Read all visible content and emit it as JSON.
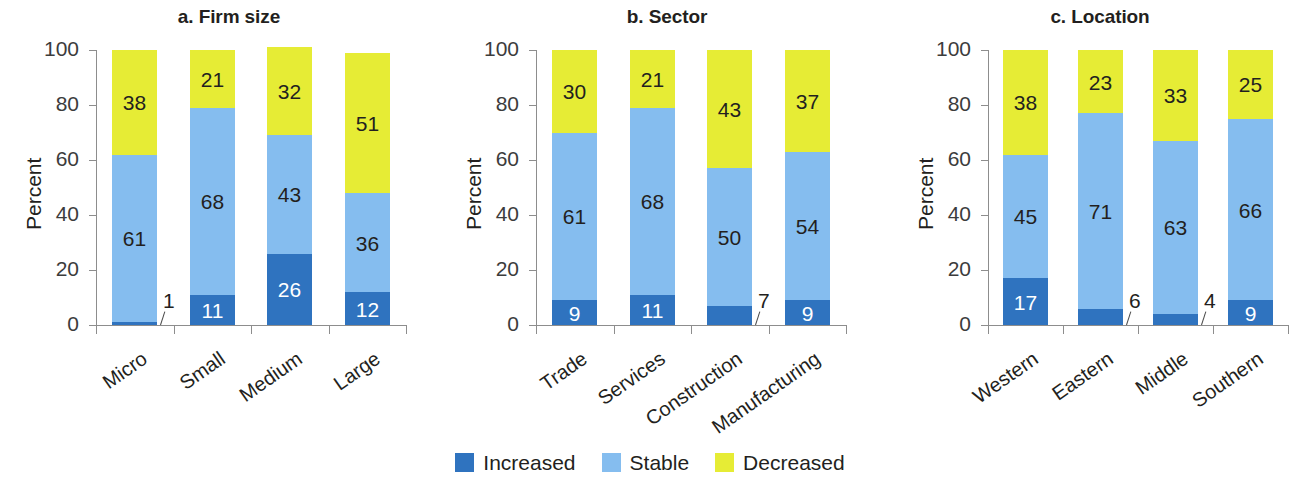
{
  "figure": {
    "y_axis_title": "Percent",
    "y_ticks": [
      "0",
      "20",
      "40",
      "60",
      "80",
      "100"
    ]
  },
  "legend": {
    "items": [
      {
        "label": "Increased",
        "color": "#2f73bf"
      },
      {
        "label": "Stable",
        "color": "#85bdef"
      },
      {
        "label": "Decreased",
        "color": "#e6ec35"
      }
    ]
  },
  "chart_data": [
    {
      "type": "bar",
      "stacked": true,
      "title": "a. Firm size",
      "xlabel": "",
      "ylabel": "Percent",
      "ylim": [
        0,
        100
      ],
      "yticks": [
        0,
        20,
        40,
        60,
        80,
        100
      ],
      "grid": false,
      "legend_position": "bottom-center-shared",
      "categories": [
        "Micro",
        "Small",
        "Medium",
        "Large"
      ],
      "series": [
        {
          "name": "Increased",
          "color": "#2f73bf",
          "values": [
            1,
            11,
            26,
            12
          ]
        },
        {
          "name": "Stable",
          "color": "#85bdef",
          "values": [
            61,
            68,
            43,
            36
          ]
        },
        {
          "name": "Decreased",
          "color": "#e6ec35",
          "values": [
            38,
            21,
            32,
            51
          ]
        }
      ]
    },
    {
      "type": "bar",
      "stacked": true,
      "title": "b. Sector",
      "xlabel": "",
      "ylabel": "Percent",
      "ylim": [
        0,
        100
      ],
      "yticks": [
        0,
        20,
        40,
        60,
        80,
        100
      ],
      "grid": false,
      "legend_position": "bottom-center-shared",
      "categories": [
        "Trade",
        "Services",
        "Construction",
        "Manufacturing"
      ],
      "series": [
        {
          "name": "Increased",
          "color": "#2f73bf",
          "values": [
            9,
            11,
            7,
            9
          ]
        },
        {
          "name": "Stable",
          "color": "#85bdef",
          "values": [
            61,
            68,
            50,
            54
          ]
        },
        {
          "name": "Decreased",
          "color": "#e6ec35",
          "values": [
            30,
            21,
            43,
            37
          ]
        }
      ]
    },
    {
      "type": "bar",
      "stacked": true,
      "title": "c. Location",
      "xlabel": "",
      "ylabel": "Percent",
      "ylim": [
        0,
        100
      ],
      "yticks": [
        0,
        20,
        40,
        60,
        80,
        100
      ],
      "grid": false,
      "legend_position": "bottom-center-shared",
      "categories": [
        "Western",
        "Eastern",
        "Middle",
        "Southern"
      ],
      "series": [
        {
          "name": "Increased",
          "color": "#2f73bf",
          "values": [
            17,
            6,
            4,
            9
          ]
        },
        {
          "name": "Stable",
          "color": "#85bdef",
          "values": [
            45,
            71,
            63,
            66
          ]
        },
        {
          "name": "Decreased",
          "color": "#e6ec35",
          "values": [
            38,
            23,
            33,
            25
          ]
        }
      ]
    }
  ]
}
